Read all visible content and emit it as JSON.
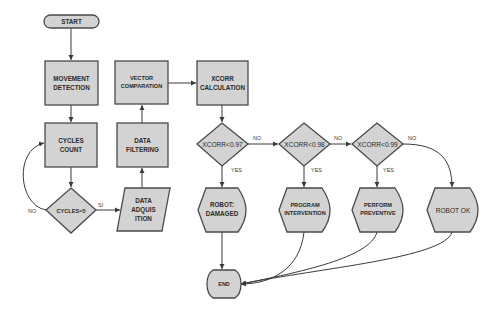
{
  "diagram": {
    "type": "flowchart",
    "colors": {
      "node_fill": "#d3d3d3",
      "node_stroke": "#4a4a4a",
      "edge": "#3a3a3a",
      "background": "#ffffff"
    },
    "nodes": {
      "start": {
        "label": "START",
        "shape": "terminator"
      },
      "movement": {
        "line1": "MOVEMENT",
        "line2": "DETECTION",
        "shape": "process"
      },
      "cycles": {
        "line1": "CYCLES",
        "line2": "COUNT",
        "shape": "process"
      },
      "cycles_check": {
        "label": "CYCLES=5",
        "shape": "decision"
      },
      "acquisition": {
        "line1": "DATA",
        "line2": "ADQUIS",
        "line3": "ITION",
        "shape": "data"
      },
      "filtering": {
        "line1": "DATA",
        "line2": "FILTERING",
        "shape": "process"
      },
      "vector": {
        "line1": "VECTOR",
        "line2": "COMPARATION",
        "shape": "process"
      },
      "xcorr": {
        "line1": "XCORR",
        "line2": "CALCULATION",
        "shape": "process"
      },
      "d1": {
        "label": "XCORR<0.97",
        "shape": "decision"
      },
      "d2": {
        "label": "XCORR<0.98",
        "shape": "decision"
      },
      "d3": {
        "label": "XCORR<0.99",
        "shape": "decision"
      },
      "damaged": {
        "line1": "ROBOT:",
        "line2": "DAMAGED",
        "shape": "display"
      },
      "intervention": {
        "line1": "PROGRAM",
        "line2": "INTERVENTION",
        "shape": "display"
      },
      "preventive": {
        "line1": "PERFORM",
        "line2": "PREVENTIVE",
        "shape": "display"
      },
      "ok": {
        "label": "ROBOT OK",
        "shape": "display"
      },
      "end": {
        "label": "END",
        "shape": "terminator"
      }
    },
    "edge_labels": {
      "cycles_no": "NO",
      "cycles_yes": "SI",
      "d1_no": "NO",
      "d1_yes": "YES",
      "d2_no": "NO",
      "d2_yes": "YES",
      "d3_no": "NO",
      "d3_yes": "YES"
    }
  }
}
